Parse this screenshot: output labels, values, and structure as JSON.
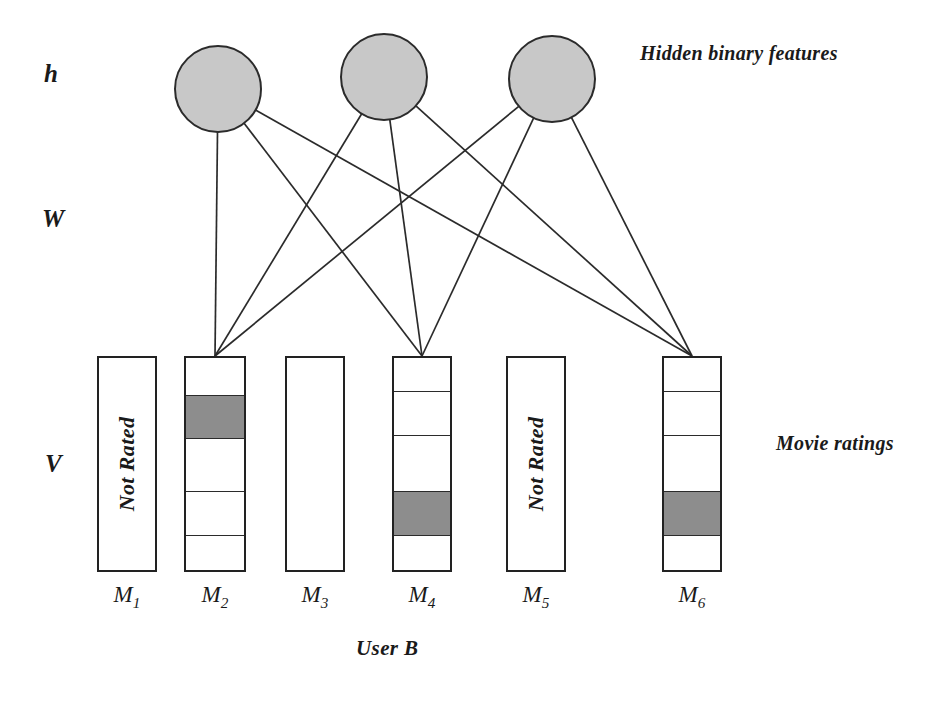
{
  "diagram": {
    "background_color": "#ffffff",
    "stroke_color": "#2b2b2b",
    "node_fill_color": "#c8c8c8",
    "filled_cell_color": "#8d8d8d",
    "empty_cell_color": "#ffffff"
  },
  "layer_labels": {
    "hidden": "h",
    "weights": "W",
    "visible": "V"
  },
  "captions": {
    "hidden": "Hidden binary features",
    "visible": "Movie ratings",
    "user": "User B"
  },
  "hidden_units": [
    {
      "id": "h1",
      "cx": 218,
      "cy": 89,
      "r": 44
    },
    {
      "id": "h2",
      "cx": 384,
      "cy": 77,
      "r": 44
    },
    {
      "id": "h3",
      "cx": 552,
      "cy": 79,
      "r": 44
    }
  ],
  "movies": [
    {
      "id": "M1",
      "label": "M",
      "subscript": "1",
      "rated": false,
      "not_rated_text": "Not Rated",
      "x": 97,
      "width": 60,
      "cells": []
    },
    {
      "id": "M2",
      "label": "M",
      "subscript": "2",
      "rated": true,
      "not_rated_text": "",
      "x": 184,
      "width": 62,
      "cells": [
        {
          "index": 1,
          "filled": false,
          "height_pct": 18
        },
        {
          "index": 2,
          "filled": true,
          "height_pct": 20
        },
        {
          "index": 3,
          "filled": false,
          "height_pct": 25
        },
        {
          "index": 4,
          "filled": false,
          "height_pct": 21
        },
        {
          "index": 5,
          "filled": false,
          "height_pct": 16
        }
      ]
    },
    {
      "id": "M3",
      "label": "M",
      "subscript": "3",
      "rated": false,
      "not_rated_text": "",
      "x": 285,
      "width": 60,
      "cells": []
    },
    {
      "id": "M4",
      "label": "M",
      "subscript": "4",
      "rated": true,
      "not_rated_text": "",
      "x": 392,
      "width": 60,
      "cells": [
        {
          "index": 1,
          "filled": false,
          "height_pct": 16
        },
        {
          "index": 2,
          "filled": false,
          "height_pct": 21
        },
        {
          "index": 3,
          "filled": false,
          "height_pct": 26
        },
        {
          "index": 4,
          "filled": true,
          "height_pct": 21
        },
        {
          "index": 5,
          "filled": false,
          "height_pct": 16
        }
      ]
    },
    {
      "id": "M5",
      "label": "M",
      "subscript": "5",
      "rated": false,
      "not_rated_text": "Not Rated",
      "x": 506,
      "width": 60,
      "cells": []
    },
    {
      "id": "M6",
      "label": "M",
      "subscript": "6",
      "rated": true,
      "not_rated_text": "",
      "x": 662,
      "width": 60,
      "cells": [
        {
          "index": 1,
          "filled": false,
          "height_pct": 16
        },
        {
          "index": 2,
          "filled": false,
          "height_pct": 21
        },
        {
          "index": 3,
          "filled": false,
          "height_pct": 26
        },
        {
          "index": 4,
          "filled": true,
          "height_pct": 21
        },
        {
          "index": 5,
          "filled": false,
          "height_pct": 16
        }
      ]
    }
  ],
  "column_geometry": {
    "top": 356,
    "bottom": 572,
    "label_y": 582
  },
  "connections": [
    {
      "from": "h1",
      "to": "M2"
    },
    {
      "from": "h1",
      "to": "M4"
    },
    {
      "from": "h1",
      "to": "M6"
    },
    {
      "from": "h2",
      "to": "M2"
    },
    {
      "from": "h2",
      "to": "M4"
    },
    {
      "from": "h2",
      "to": "M6"
    },
    {
      "from": "h3",
      "to": "M2"
    },
    {
      "from": "h3",
      "to": "M4"
    },
    {
      "from": "h3",
      "to": "M6"
    }
  ]
}
